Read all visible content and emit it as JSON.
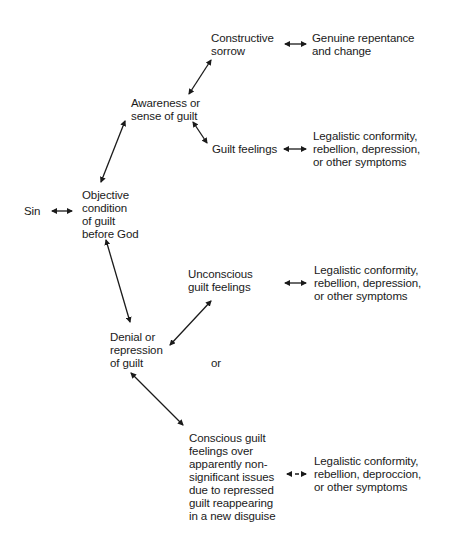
{
  "diagram": {
    "nodes": {
      "sin": "Sin",
      "objective": "Objective\ncondition\nof guilt\nbefore God",
      "awareness": "Awareness or\nsense of guilt",
      "constructive": "Constructive\nsorrow",
      "genuine": "Genuine repentance\nand change",
      "guilt_feelings": "Guilt feelings",
      "symptoms_1": "Legalistic conformity,\nrebellion, depression,\nor other symptoms",
      "denial": "Denial or\nrepression\nof guilt",
      "unconscious": "Unconscious\nguilt feelings",
      "symptoms_2": "Legalistic conformity,\nrebellion, depression,\nor other symptoms",
      "or_label": "or",
      "conscious": "Conscious guilt\nfeelings over\napparently non-\nsignificant issues\ndue to repressed\nguilt reappearing\nin a new disguise",
      "symptoms_3": "Legalistic conformity,\nrebellion, deproccion,\nor other symptoms"
    },
    "edges": [
      {
        "from": "sin",
        "to": "objective",
        "type": "bidirectional"
      },
      {
        "from": "objective",
        "to": "awareness",
        "type": "bidirectional"
      },
      {
        "from": "awareness",
        "to": "constructive",
        "type": "bidirectional"
      },
      {
        "from": "constructive",
        "to": "genuine",
        "type": "bidirectional"
      },
      {
        "from": "awareness",
        "to": "guilt_feelings",
        "type": "bidirectional"
      },
      {
        "from": "guilt_feelings",
        "to": "symptoms_1",
        "type": "bidirectional"
      },
      {
        "from": "objective",
        "to": "denial",
        "type": "bidirectional"
      },
      {
        "from": "denial",
        "to": "unconscious",
        "type": "bidirectional"
      },
      {
        "from": "unconscious",
        "to": "symptoms_2",
        "type": "bidirectional"
      },
      {
        "from": "denial",
        "to": "conscious",
        "type": "bidirectional"
      },
      {
        "from": "conscious",
        "to": "symptoms_3",
        "type": "bidirectional"
      }
    ],
    "colors": {
      "ink": "#1a1a1a",
      "background": "#ffffff"
    }
  }
}
